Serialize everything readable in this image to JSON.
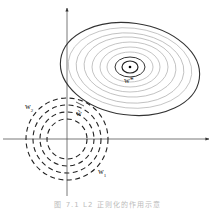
{
  "figure": {
    "axes": {
      "origin": [
        67,
        139
      ],
      "x_arrow_end": 210,
      "y_arrow_end": 8
    },
    "loss_contours": {
      "center": [
        129,
        67
      ],
      "style": "solid",
      "outer_color": "#333333",
      "inner_color": "#aaaaaa",
      "optimum_label": "w*"
    },
    "regularizer_contours": {
      "center": [
        67,
        139
      ],
      "style": "dashed",
      "color": "#222222",
      "radii": [
        20,
        27,
        34,
        41
      ]
    },
    "labels": {
      "w_star": "w*",
      "w_tilde": "w̃",
      "w1_base": "w",
      "w1_sub": "1",
      "w2_base": "w",
      "w2_sub": "2"
    },
    "caption": "图 7.1  L2 正则化的作用示意"
  }
}
